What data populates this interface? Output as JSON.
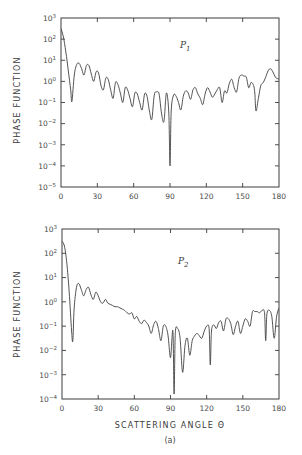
{
  "figure": {
    "caption_label": "(a)",
    "footer_text": "Fig. — phase function scattering angle distribution"
  },
  "chart_data": [
    {
      "type": "line",
      "panel_label": "P1",
      "panel_label_main": "P",
      "panel_label_sub": "1",
      "ylabel": "PHASE FUNCTION",
      "xlabel": "",
      "yscale": "log",
      "xlim": [
        0,
        180
      ],
      "ylim_log10": [
        -5,
        3
      ],
      "xticks": [
        0,
        30,
        60,
        90,
        120,
        150,
        180
      ],
      "ytick_labels": [
        "10^3",
        "10^2",
        "10^1",
        "10^0",
        "10^-1",
        "10^-2",
        "10^-3",
        "10^-4",
        "10^-5"
      ],
      "grid": false,
      "series": [
        {
          "name": "P1",
          "x": [
            0,
            2,
            4,
            6,
            8,
            9,
            11,
            13,
            15,
            17,
            19,
            21,
            23,
            25,
            27,
            29,
            31,
            33,
            35,
            37,
            39,
            41,
            43,
            45,
            47,
            49,
            51,
            53,
            55,
            57,
            59,
            61,
            63,
            65,
            67,
            69,
            71,
            73,
            75,
            77,
            79,
            81,
            83,
            85,
            87,
            89,
            90,
            91,
            93,
            95,
            97,
            99,
            101,
            103,
            105,
            107,
            109,
            111,
            113,
            115,
            117,
            119,
            121,
            123,
            125,
            127,
            129,
            131,
            133,
            135,
            137,
            139,
            141,
            143,
            145,
            147,
            149,
            151,
            153,
            155,
            157,
            159,
            160,
            161,
            163,
            165,
            167,
            169,
            171,
            173,
            175,
            177,
            180
          ],
          "log10_y": [
            2.5,
            2.1,
            1.4,
            0.5,
            -0.4,
            -0.95,
            0.3,
            0.8,
            0.85,
            0.6,
            0.3,
            0.75,
            0.75,
            0.35,
            0.0,
            0.45,
            0.4,
            -0.2,
            -0.4,
            0.15,
            0.1,
            -0.4,
            -0.8,
            -0.05,
            -0.15,
            -0.55,
            -1.0,
            -0.3,
            -0.4,
            -0.8,
            -1.2,
            -0.55,
            -0.6,
            -1.0,
            -1.35,
            -0.6,
            -0.7,
            -1.4,
            -1.8,
            -0.65,
            -0.5,
            -0.6,
            -1.5,
            -1.9,
            -0.55,
            -1.5,
            -4.0,
            -1.4,
            -0.65,
            -0.7,
            -1.0,
            -1.35,
            -0.7,
            -0.45,
            -0.55,
            -0.85,
            -0.4,
            -0.3,
            -0.6,
            -0.8,
            -1.1,
            -0.6,
            -0.3,
            -0.5,
            -0.75,
            -0.6,
            -0.4,
            -0.3,
            -1.0,
            -0.45,
            -0.55,
            -0.1,
            0.1,
            -0.3,
            -0.5,
            0.15,
            0.3,
            0.25,
            0.2,
            -0.3,
            -0.05,
            -0.2,
            -0.55,
            -1.4,
            -0.8,
            -0.2,
            -0.05,
            0.2,
            0.5,
            0.6,
            0.45,
            0.2,
            0.1
          ]
        }
      ]
    },
    {
      "type": "line",
      "panel_label": "P2",
      "panel_label_main": "P",
      "panel_label_sub": "2",
      "ylabel": "PHASE FUNCTION",
      "xlabel": "SCATTERING ANGLE Θ",
      "yscale": "log",
      "xlim": [
        0,
        180
      ],
      "ylim_log10": [
        -4,
        3
      ],
      "xticks": [
        0,
        30,
        60,
        90,
        120,
        150,
        180
      ],
      "ytick_labels": [
        "10^3",
        "10^2",
        "10^1",
        "10^0",
        "10^-1",
        "10^-2",
        "10^-3",
        "10^-4"
      ],
      "grid": false,
      "series": [
        {
          "name": "P2",
          "x": [
            0,
            2,
            4,
            6,
            8,
            9,
            10,
            12,
            14,
            16,
            18,
            20,
            22,
            24,
            26,
            28,
            30,
            32,
            34,
            36,
            38,
            40,
            42,
            44,
            46,
            48,
            50,
            52,
            54,
            56,
            58,
            60,
            62,
            64,
            66,
            68,
            70,
            72,
            74,
            76,
            78,
            80,
            82,
            84,
            86,
            88,
            90,
            92,
            93,
            94,
            96,
            98,
            100,
            102,
            104,
            106,
            108,
            110,
            112,
            114,
            116,
            118,
            120,
            122,
            123,
            124,
            126,
            128,
            130,
            132,
            134,
            136,
            138,
            140,
            142,
            144,
            146,
            148,
            150,
            152,
            154,
            156,
            158,
            160,
            162,
            164,
            166,
            168,
            169,
            170,
            172,
            174,
            176,
            178,
            180
          ],
          "log10_y": [
            2.5,
            2.3,
            1.6,
            0.4,
            -1.2,
            -1.6,
            -0.3,
            0.6,
            0.75,
            0.5,
            0.25,
            0.5,
            0.6,
            0.3,
            0.1,
            0.4,
            0.25,
            0.0,
            -0.05,
            0.1,
            -0.05,
            -0.1,
            -0.15,
            -0.2,
            -0.2,
            -0.25,
            -0.3,
            -0.35,
            -0.45,
            -0.5,
            -0.45,
            -0.7,
            -0.6,
            -0.8,
            -0.9,
            -0.75,
            -0.85,
            -1.0,
            -1.3,
            -0.95,
            -0.8,
            -1.1,
            -1.6,
            -1.0,
            -1.0,
            -1.4,
            -2.3,
            -1.2,
            -3.8,
            -1.3,
            -1.1,
            -1.5,
            -2.9,
            -1.8,
            -1.5,
            -2.2,
            -1.6,
            -1.4,
            -1.3,
            -1.4,
            -1.5,
            -1.2,
            -1.0,
            -1.1,
            -2.6,
            -1.2,
            -0.95,
            -1.1,
            -0.85,
            -0.8,
            -1.2,
            -0.7,
            -0.7,
            -0.9,
            -1.35,
            -1.0,
            -0.8,
            -1.3,
            -1.0,
            -0.7,
            -0.8,
            -1.0,
            -0.4,
            -0.4,
            -0.4,
            -0.45,
            -0.35,
            -0.45,
            -1.6,
            -0.5,
            -0.35,
            -0.6,
            -1.5,
            -0.6,
            -0.25
          ]
        }
      ]
    }
  ]
}
